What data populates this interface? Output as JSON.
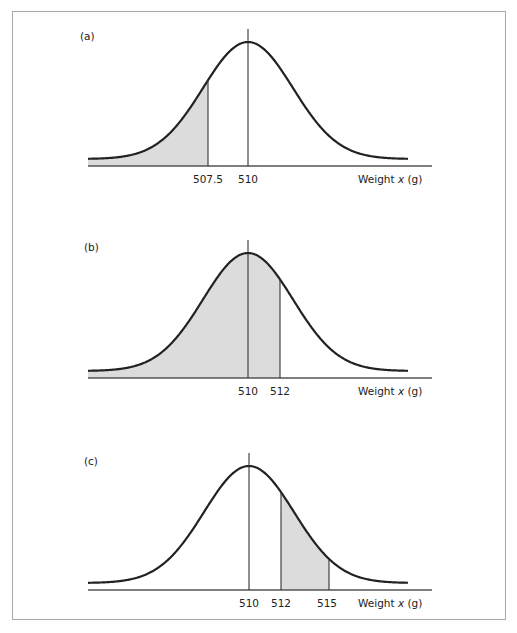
{
  "chart_data": [
    {
      "type": "area",
      "panel_label": "(a)",
      "title": "",
      "xlabel": "Weight x (g)",
      "ylabel": "",
      "distribution": "normal",
      "mean": 510,
      "tick_labels": [
        "507.5",
        "510"
      ],
      "ticks": [
        507.5,
        510
      ],
      "shaded_region": {
        "from": "-inf",
        "to": 507.5
      },
      "grid": false
    },
    {
      "type": "area",
      "panel_label": "(b)",
      "title": "",
      "xlabel": "Weight x (g)",
      "ylabel": "",
      "distribution": "normal",
      "mean": 510,
      "tick_labels": [
        "510",
        "512"
      ],
      "ticks": [
        510,
        512
      ],
      "shaded_region": {
        "from": "-inf",
        "to": 512
      },
      "grid": false
    },
    {
      "type": "area",
      "panel_label": "(c)",
      "title": "",
      "xlabel": "Weight x (g)",
      "ylabel": "",
      "distribution": "normal",
      "mean": 510,
      "tick_labels": [
        "510",
        "512",
        "515"
      ],
      "ticks": [
        510,
        512,
        515
      ],
      "shaded_region": {
        "from": 512,
        "to": 515
      },
      "grid": false
    }
  ],
  "panels": [
    {
      "label": "(a)",
      "xlabel": "Weight x (g)",
      "ticks": [
        "507.5",
        "510"
      ]
    },
    {
      "label": "(b)",
      "xlabel": "Weight x (g)",
      "ticks": [
        "510",
        "512"
      ]
    },
    {
      "label": "(c)",
      "xlabel": "Weight x (g)",
      "ticks": [
        "510",
        "512",
        "515"
      ]
    }
  ],
  "colors": {
    "fill": "#dcdcdc",
    "curve": "#222222",
    "axis": "#555555",
    "frame": "#a8a8a8"
  }
}
